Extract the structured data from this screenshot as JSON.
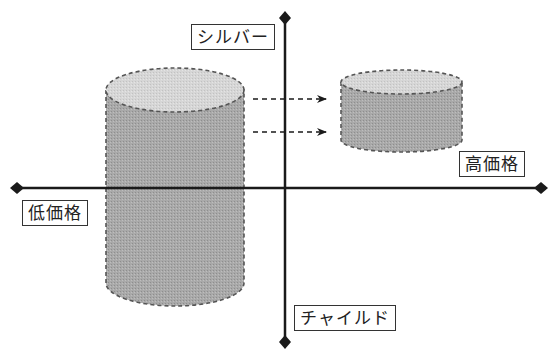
{
  "diagram": {
    "title": "",
    "axes": {
      "top_label": "シルバー",
      "bottom_label": "チャイルド",
      "left_label": "低価格",
      "right_label": "高価格"
    },
    "shapes": [
      {
        "name": "large-cylinder",
        "description": "current position (low price, spanning silver to child)"
      },
      {
        "name": "small-cylinder",
        "description": "target position (high price, silver side)"
      }
    ],
    "arrows": [
      {
        "from": "large-cylinder",
        "to": "small-cylinder",
        "style": "dashed"
      },
      {
        "from": "large-cylinder",
        "to": "small-cylinder",
        "style": "dashed"
      }
    ],
    "colors": {
      "axis": "#1a1a1a",
      "cylinder_body": "#a8a8a8",
      "cylinder_top": "#d4d4d4",
      "outline": "#555555"
    }
  }
}
